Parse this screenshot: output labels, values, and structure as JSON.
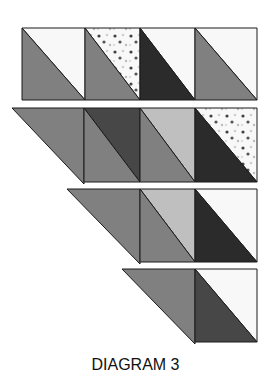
{
  "caption": "DIAGRAM 3",
  "colors": {
    "medium": "#808080",
    "dark": "#2b2b2b",
    "darkgray": "#474747",
    "light": "#bfbfbf",
    "white": "#f8f8f8",
    "outline": "#1a1a1a",
    "dots_dark": "#444444",
    "dots_light": "#cfcfcf"
  },
  "rows": [
    {
      "name": "row-1",
      "top": 28,
      "bottom": 100,
      "left_triangle": null,
      "blocks": [
        {
          "x0": 22,
          "x1": 85,
          "upper": "white",
          "lower": "medium"
        },
        {
          "x0": 85,
          "x1": 140,
          "upper": "dots",
          "lower": "medium"
        },
        {
          "x0": 140,
          "x1": 195,
          "upper": "white",
          "lower": "dark"
        },
        {
          "x0": 195,
          "x1": 257,
          "upper": "white",
          "lower": "medium"
        }
      ]
    },
    {
      "name": "row-2",
      "top": 108,
      "bottom": 182,
      "left_triangle": {
        "x0": 12,
        "x1": 84,
        "color": "medium"
      },
      "blocks": [
        {
          "x0": 84,
          "x1": 140,
          "upper": "darkgray",
          "lower": "medium"
        },
        {
          "x0": 140,
          "x1": 195,
          "upper": "light",
          "lower": "medium"
        },
        {
          "x0": 195,
          "x1": 257,
          "upper": "dots",
          "lower": "dark"
        }
      ]
    },
    {
      "name": "row-3",
      "top": 189,
      "bottom": 262,
      "left_triangle": {
        "x0": 67,
        "x1": 140,
        "color": "medium"
      },
      "blocks": [
        {
          "x0": 140,
          "x1": 195,
          "upper": "light",
          "lower": "medium"
        },
        {
          "x0": 195,
          "x1": 257,
          "upper": "white",
          "lower": "dark"
        }
      ]
    },
    {
      "name": "row-4",
      "top": 269,
      "bottom": 342,
      "left_triangle": {
        "x0": 122,
        "x1": 195,
        "color": "medium"
      },
      "blocks": [
        {
          "x0": 195,
          "x1": 257,
          "upper": "white",
          "lower": "darkgray"
        }
      ]
    }
  ]
}
